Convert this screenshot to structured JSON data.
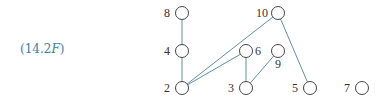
{
  "equation_label": {
    "prefix": "(14.2",
    "italic": "F",
    "suffix": ")"
  },
  "colors": {
    "edge": "#5f8ea3",
    "node_stroke": "#444444",
    "label": "#3d7ea6"
  },
  "nodes": [
    {
      "id": "8",
      "label": "8",
      "cx": 182,
      "cy": 13,
      "lx": 170,
      "ly": 17,
      "anchor": "end"
    },
    {
      "id": "4",
      "label": "4",
      "cx": 182,
      "cy": 51,
      "lx": 170,
      "ly": 55,
      "anchor": "end"
    },
    {
      "id": "2",
      "label": "2",
      "cx": 182,
      "cy": 88,
      "lx": 170,
      "ly": 92,
      "anchor": "end"
    },
    {
      "id": "10",
      "label": "10",
      "cx": 278,
      "cy": 13,
      "lx": 268,
      "ly": 17,
      "anchor": "end"
    },
    {
      "id": "6",
      "label": "6",
      "cx": 246,
      "cy": 51,
      "lx": 255,
      "ly": 55,
      "anchor": "start"
    },
    {
      "id": "9",
      "label": "9",
      "cx": 278,
      "cy": 51,
      "lx": 278,
      "ly": 68,
      "anchor": "middle"
    },
    {
      "id": "3",
      "label": "3",
      "cx": 246,
      "cy": 88,
      "lx": 234,
      "ly": 92,
      "anchor": "end"
    },
    {
      "id": "5",
      "label": "5",
      "cx": 310,
      "cy": 88,
      "lx": 298,
      "ly": 92,
      "anchor": "end"
    },
    {
      "id": "7",
      "label": "7",
      "cx": 362,
      "cy": 88,
      "lx": 350,
      "ly": 92,
      "anchor": "end"
    }
  ],
  "edges": [
    [
      "8",
      "4"
    ],
    [
      "4",
      "2"
    ],
    [
      "2",
      "10"
    ],
    [
      "2",
      "6"
    ],
    [
      "6",
      "3"
    ],
    [
      "3",
      "9"
    ],
    [
      "10",
      "5"
    ]
  ]
}
